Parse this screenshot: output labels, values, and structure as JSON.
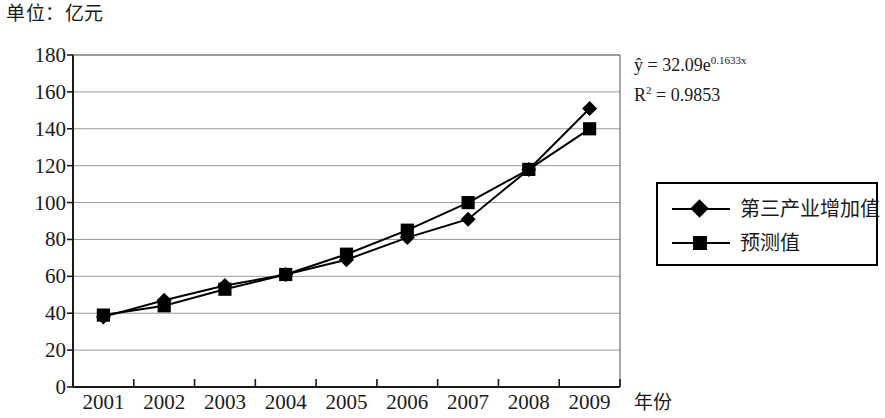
{
  "unit_label": "单位：亿元",
  "annotation": {
    "equation_prefix": "ŷ = 32.09e",
    "equation_exponent": "0.1633x",
    "r_squared_prefix": "R",
    "r_squared_sup": "2",
    "r_squared_value": " = 0.9853"
  },
  "axis": {
    "x_name": "年份",
    "y_ticks": [
      "180",
      "160",
      "140",
      "120",
      "100",
      "80",
      "60",
      "40",
      "20",
      "0"
    ],
    "x_ticks": [
      "2001",
      "2002",
      "2003",
      "2004",
      "2005",
      "2006",
      "2007",
      "2008",
      "2009"
    ]
  },
  "legend": {
    "items": [
      {
        "label": "第三产业增加值",
        "marker": "diamond",
        "color": "#000000"
      },
      {
        "label": "预测值",
        "marker": "square",
        "color": "#000000"
      }
    ]
  },
  "colors": {
    "series": "#000000",
    "gridline": "#9a9a9a",
    "axis": "#1a1a1a",
    "background": "#ffffff"
  },
  "chart_data": {
    "type": "line",
    "title": "",
    "subtitle": "",
    "xlabel": "年份",
    "ylabel": "单位：亿元",
    "categories": [
      "2001",
      "2002",
      "2003",
      "2004",
      "2005",
      "2006",
      "2007",
      "2008",
      "2009"
    ],
    "series": [
      {
        "name": "第三产业增加值",
        "marker": "diamond",
        "values": [
          38,
          47,
          55,
          61,
          69,
          81,
          91,
          118,
          151
        ]
      },
      {
        "name": "预测值",
        "marker": "square",
        "values": [
          39,
          44,
          53,
          61,
          72,
          85,
          100,
          118,
          140
        ]
      }
    ],
    "ylim": [
      0,
      180
    ],
    "ytick_step": 20,
    "grid": true,
    "grid_axis": "y",
    "legend_position": "right",
    "annotations": [
      "ŷ = 32.09e^0.1633x",
      "R² = 0.9853"
    ]
  }
}
